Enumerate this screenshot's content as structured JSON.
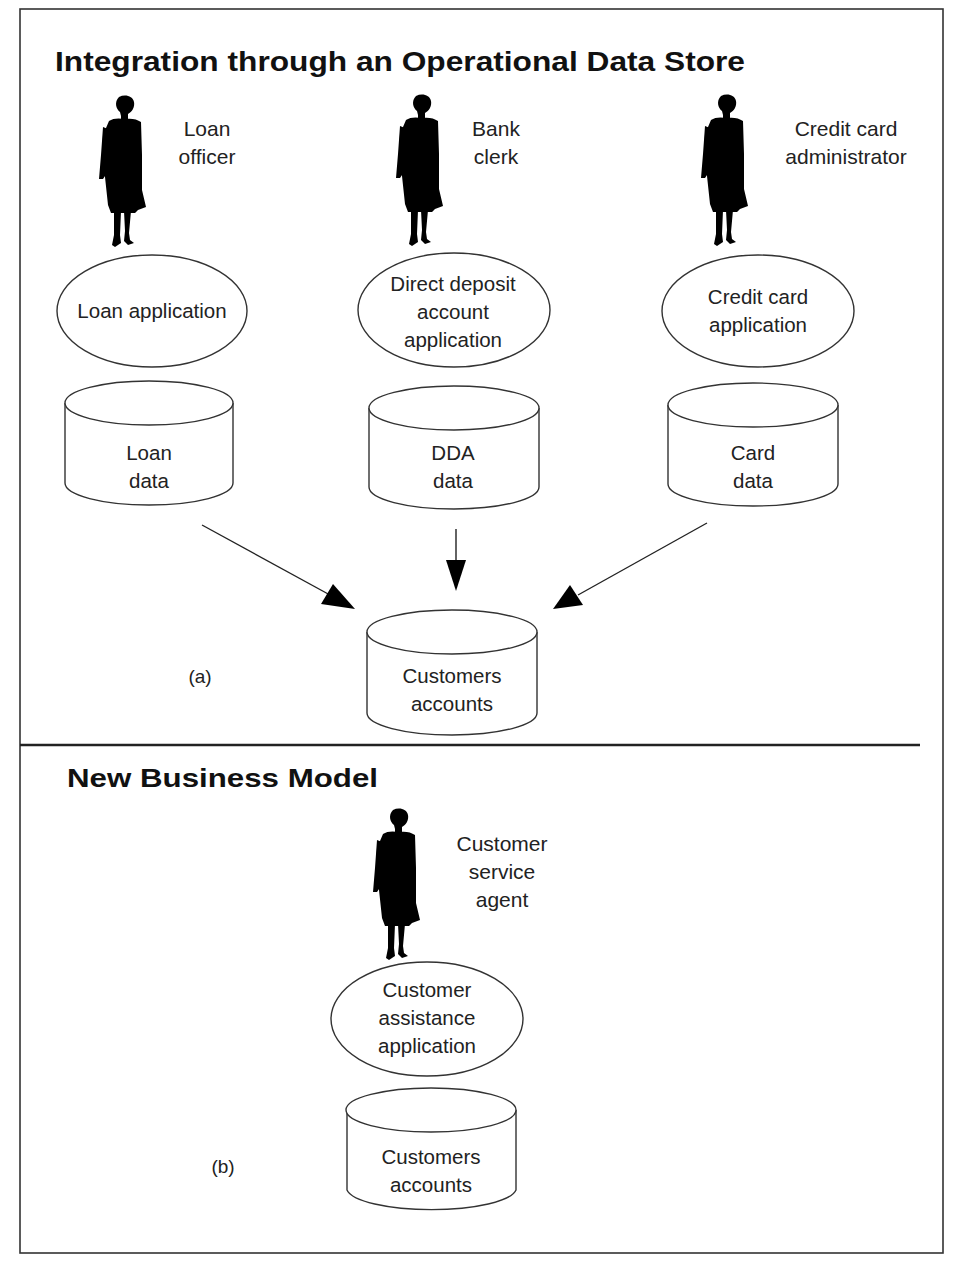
{
  "section_a": {
    "title": "Integration through an Operational Data Store",
    "panel_label": "(a)",
    "actors": [
      {
        "name_line1": "Loan",
        "name_line2": "officer",
        "icon": "person-silhouette-icon"
      },
      {
        "name_line1": "Bank",
        "name_line2": "clerk",
        "icon": "person-silhouette-icon"
      },
      {
        "name_line1": "Credit card",
        "name_line2": "administrator",
        "icon": "person-silhouette-icon"
      }
    ],
    "applications": [
      {
        "lines": [
          "Loan application"
        ]
      },
      {
        "lines": [
          "Direct deposit",
          "account",
          "application"
        ]
      },
      {
        "lines": [
          "Credit card",
          "application"
        ]
      }
    ],
    "data_stores": [
      {
        "line1": "Loan",
        "line2": "data"
      },
      {
        "line1": "DDA",
        "line2": "data"
      },
      {
        "line1": "Card",
        "line2": "data"
      }
    ],
    "target_store": {
      "line1": "Customers",
      "line2": "accounts"
    }
  },
  "section_b": {
    "title": "New Business Model",
    "panel_label": "(b)",
    "actor": {
      "name_line1": "Customer",
      "name_line2": "service",
      "name_line3": "agent",
      "icon": "person-silhouette-icon"
    },
    "application": {
      "line1": "Customer",
      "line2": "assistance",
      "line3": "application"
    },
    "data_store": {
      "line1": "Customers",
      "line2": "accounts"
    }
  },
  "colors": {
    "line": "#333333",
    "text": "#222222",
    "fill": "#000000",
    "background": "#ffffff"
  }
}
